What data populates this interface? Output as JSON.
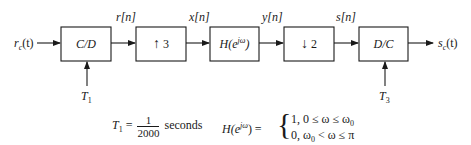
{
  "diagram": {
    "input_signal": {
      "base": "r",
      "sub": "c",
      "arg": "(t)"
    },
    "output_signal": {
      "base": "s",
      "sub": "c",
      "arg": "(t)"
    },
    "blocks": [
      {
        "id": "cd",
        "label": "C/D"
      },
      {
        "id": "upsample",
        "arrow": "↑",
        "factor": "3"
      },
      {
        "id": "filter",
        "label_base": "H(e",
        "label_sup": "jω",
        "label_close": ")"
      },
      {
        "id": "downsample",
        "arrow": "↓",
        "factor": "2"
      },
      {
        "id": "dc",
        "label": "D/C"
      }
    ],
    "signals": [
      "r[n]",
      "x[n]",
      "y[n]",
      "s[n]"
    ],
    "sampling_inputs": [
      {
        "base": "T",
        "sub": "1"
      },
      {
        "base": "T",
        "sub": "3"
      }
    ],
    "line_color": "#1a1a1a"
  },
  "equations": {
    "t1": {
      "lhs_base": "T",
      "lhs_sub": "1",
      "eq": " = ",
      "num": "1",
      "den": "2000",
      "unit": "seconds"
    },
    "h": {
      "lhs_base": "H(e",
      "lhs_sup": "jω",
      "lhs_close": ") = ",
      "case1": "1, 0 ≤  ω  ≤ ω",
      "case1_sub": "0",
      "case2_a": "0, ω",
      "case2_sub": "0",
      "case2_b": " <  ω  ≤ π"
    }
  }
}
